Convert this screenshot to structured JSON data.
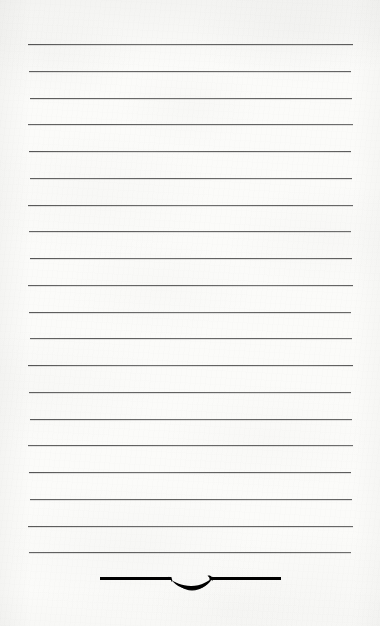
{
  "page": {
    "kind": "ruled-notepaper-scan",
    "width": 380,
    "height": 626,
    "paper_color": "#fbfbf9",
    "rule_color": "#4f4f4f",
    "ornament_color": "#1c1c1c",
    "text_content": "",
    "visible_text": []
  },
  "rules": {
    "count": 20,
    "first_y": 44,
    "spacing": 26.75,
    "left_x": 29,
    "right_x": 352,
    "thickness": 1,
    "y_positions": [
      44,
      70.8,
      97.5,
      124.3,
      151,
      177.8,
      204.5,
      231.3,
      258,
      284.8,
      311.5,
      338.3,
      365,
      391.8,
      418.5,
      445.3,
      472,
      498.8,
      525.5,
      552.3
    ]
  },
  "ornament": {
    "name": "leaf-flourish-divider",
    "center_x": 190,
    "y": 578,
    "rule_left_x": 100,
    "rule_right_x": 281,
    "rule_thickness": 3,
    "glyph_width": 46,
    "glyph_height": 17,
    "color": "#1c1c1c"
  }
}
